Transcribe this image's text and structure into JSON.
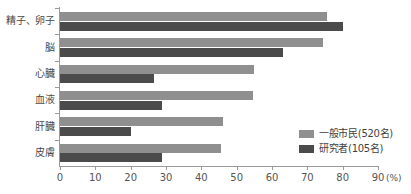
{
  "chart_data": {
    "type": "bar",
    "orientation": "horizontal",
    "title": "",
    "xlabel": "(%)",
    "ylabel": "",
    "xlim": [
      0,
      90
    ],
    "xticks": [
      0,
      10,
      20,
      30,
      40,
      50,
      60,
      70,
      80,
      90
    ],
    "xtick_labels": [
      "0",
      "10",
      "20",
      "30",
      "40",
      "50",
      "60",
      "70",
      "80",
      "90"
    ],
    "unit_label": "(%)",
    "grid": false,
    "legend_position": "inner-right",
    "categories": [
      "精子、卵子",
      "脳",
      "心臓",
      "血液",
      "肝臓",
      "皮膚"
    ],
    "series": [
      {
        "name": "一般市民(520名)",
        "color": "#8f8f8f",
        "values": [
          75.5,
          74.5,
          55.0,
          54.5,
          46.0,
          45.5
        ]
      },
      {
        "name": "研究者(105名)",
        "color": "#4b4b4b",
        "values": [
          80.0,
          63.0,
          26.5,
          29.0,
          20.0,
          29.0
        ]
      }
    ]
  },
  "legend": {
    "items": [
      {
        "label": "一般市民(520名)",
        "color": "#8f8f8f"
      },
      {
        "label": "研究者(105名)",
        "color": "#4b4b4b"
      }
    ]
  },
  "axis": {
    "unit": "(%)",
    "tick_labels": [
      "0",
      "10",
      "20",
      "30",
      "40",
      "50",
      "60",
      "70",
      "80",
      "90"
    ]
  },
  "colors": {
    "series_light": "#8f8f8f",
    "series_dark": "#4b4b4b",
    "axis": "#9a9a9a",
    "text": "#555555",
    "background": "#ffffff"
  }
}
